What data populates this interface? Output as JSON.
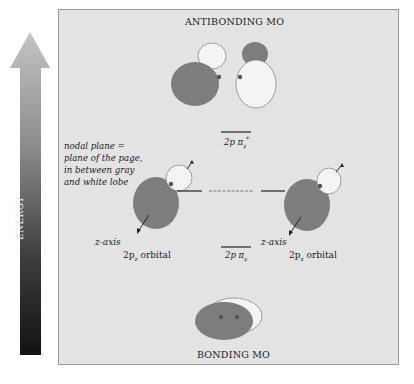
{
  "energy_axis": {
    "label": "ENERGY",
    "direction": "up",
    "gradient_top": "#bdbdbd",
    "gradient_bottom": "#141414"
  },
  "diagram": {
    "top_title": "ANTIBONDING MO",
    "bottom_title": "BONDING MO",
    "nodal_note": {
      "line1": "nodal plane =",
      "line2": "plane of the page,",
      "line3": "in between gray",
      "line4": "and white lobe"
    },
    "left_orbital": {
      "axis_label": "z-axis",
      "name_prefix": "2p",
      "name_sub": "z",
      "name_suffix": " orbital"
    },
    "right_orbital": {
      "axis_label": "z-axis",
      "name_prefix": "2p",
      "name_sub": "z",
      "name_suffix": " orbital"
    },
    "antibonding_level": {
      "label_prefix": "2p π",
      "label_sub": "z",
      "label_sup": "*"
    },
    "bonding_level": {
      "label_prefix": "2p π",
      "label_sub": "z"
    },
    "colors": {
      "background": "#e3e3e3",
      "gray_lobe": "#7d7d7d",
      "white_lobe": "#f4f4f4",
      "lobe_outline": "#8a8a8a",
      "nucleus": "#555555",
      "frame_border": "#9a9a9a"
    }
  }
}
